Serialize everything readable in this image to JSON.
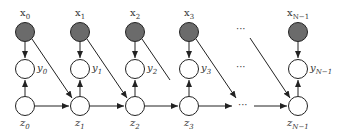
{
  "diagram": {
    "type": "graphical-model",
    "columns": [
      {
        "x_label": "x",
        "x_sub": "0",
        "y_label": "y",
        "y_sub": "0",
        "z_label": "z",
        "z_sub": "0",
        "cx": 25
      },
      {
        "x_label": "x",
        "x_sub": "1",
        "y_label": "y",
        "y_sub": "1",
        "z_label": "z",
        "z_sub": "1",
        "cx": 80
      },
      {
        "x_label": "x",
        "x_sub": "2",
        "y_label": "y",
        "y_sub": "2",
        "z_label": "z",
        "z_sub": "2",
        "cx": 135
      },
      {
        "x_label": "x",
        "x_sub": "3",
        "y_label": "y",
        "y_sub": "3",
        "z_label": "z",
        "z_sub": "3",
        "cx": 189
      },
      {
        "x_label": "x",
        "x_sub": "N−1",
        "y_label": "y",
        "y_sub": "N−1",
        "z_label": "z",
        "z_sub": "N−1",
        "cx": 298
      }
    ],
    "ellipsis": "···",
    "colors": {
      "observed_fill": "#6b6b6b",
      "latent_fill": "#ffffff",
      "stroke": "#222222"
    }
  }
}
